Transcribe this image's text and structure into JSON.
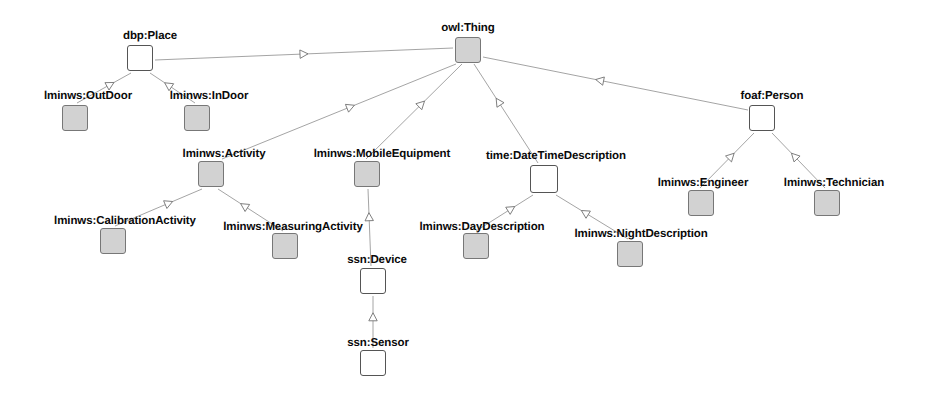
{
  "diagram": {
    "kind": "ontology-class-hierarchy",
    "background_color": "#ffffff",
    "node_fill_shaded": "#d2d2d2",
    "node_fill_hollow": "#ffffff",
    "edge_color": "#9a9a9a",
    "label_color": "#0a0a0a",
    "edge_style": "uml-generalization-hollow-triangle"
  },
  "nodes": [
    {
      "id": "owl_thing",
      "label": "owl:Thing",
      "fill": "filled",
      "box": {
        "x": 455,
        "y": 37,
        "w": 26,
        "h": 26
      },
      "label_x": 468,
      "label_y": 22
    },
    {
      "id": "dbp_place",
      "label": "dbp:Place",
      "fill": "hollow",
      "box": {
        "x": 127,
        "y": 45,
        "w": 26,
        "h": 26
      },
      "label_x": 150,
      "label_y": 30
    },
    {
      "id": "lminws_outdoor",
      "label": "lminws:OutDoor",
      "fill": "filled",
      "box": {
        "x": 62,
        "y": 105,
        "w": 26,
        "h": 26
      },
      "label_x": 88,
      "label_y": 90
    },
    {
      "id": "lminws_indoor",
      "label": "lminws:InDoor",
      "fill": "filled",
      "box": {
        "x": 184,
        "y": 105,
        "w": 26,
        "h": 26
      },
      "label_x": 209,
      "label_y": 90
    },
    {
      "id": "foaf_person",
      "label": "foaf:Person",
      "fill": "hollow",
      "box": {
        "x": 749,
        "y": 105,
        "w": 26,
        "h": 26
      },
      "label_x": 772,
      "label_y": 90
    },
    {
      "id": "lminws_activity",
      "label": "lminws:Activity",
      "fill": "filled",
      "box": {
        "x": 198,
        "y": 161,
        "w": 26,
        "h": 26
      },
      "label_x": 224,
      "label_y": 148
    },
    {
      "id": "lminws_mobileequip",
      "label": "lminws:MobileEquipment",
      "fill": "filled",
      "box": {
        "x": 354,
        "y": 161,
        "w": 26,
        "h": 26
      },
      "label_x": 382,
      "label_y": 148
    },
    {
      "id": "time_datetimedesc",
      "label": "time:DateTimeDescription",
      "fill": "hollow",
      "box": {
        "x": 530,
        "y": 165,
        "w": 28,
        "h": 28
      },
      "label_x": 556,
      "label_y": 150
    },
    {
      "id": "lminws_engineer",
      "label": "lminws:Engineer",
      "fill": "filled",
      "box": {
        "x": 688,
        "y": 190,
        "w": 26,
        "h": 26
      },
      "label_x": 703,
      "label_y": 177
    },
    {
      "id": "lminws_technician",
      "label": "lminws:Technician",
      "fill": "filled",
      "box": {
        "x": 814,
        "y": 190,
        "w": 26,
        "h": 26
      },
      "label_x": 834,
      "label_y": 177
    },
    {
      "id": "lminws_calibration",
      "label": "lminws:CalibrationActivity",
      "fill": "filled",
      "box": {
        "x": 100,
        "y": 228,
        "w": 26,
        "h": 26
      },
      "label_x": 125,
      "label_y": 215
    },
    {
      "id": "lminws_measuring",
      "label": "lminws:MeasuringActivity",
      "fill": "filled",
      "box": {
        "x": 272,
        "y": 233,
        "w": 26,
        "h": 26
      },
      "label_x": 293,
      "label_y": 221
    },
    {
      "id": "lminws_daydesc",
      "label": "lminws:DayDescription",
      "fill": "filled",
      "box": {
        "x": 463,
        "y": 233,
        "w": 26,
        "h": 26
      },
      "label_x": 482,
      "label_y": 221
    },
    {
      "id": "lminws_nightdesc",
      "label": "lminws:NightDescription",
      "fill": "filled",
      "box": {
        "x": 617,
        "y": 241,
        "w": 26,
        "h": 26
      },
      "label_x": 641,
      "label_y": 228
    },
    {
      "id": "ssn_device",
      "label": "ssn:Device",
      "fill": "hollow",
      "box": {
        "x": 360,
        "y": 268,
        "w": 26,
        "h": 26
      },
      "label_x": 377,
      "label_y": 254
    },
    {
      "id": "ssn_sensor",
      "label": "ssn:Sensor",
      "fill": "hollow",
      "box": {
        "x": 360,
        "y": 350,
        "w": 26,
        "h": 26
      },
      "label_x": 378,
      "label_y": 337
    }
  ],
  "edges": [
    {
      "id": "e_place_thing",
      "from": "dbp_place",
      "to": "owl_thing",
      "x1": 155,
      "y1": 60,
      "x2": 453,
      "y2": 48,
      "arrow_t": 0.5
    },
    {
      "id": "e_outdoor_place",
      "from": "lminws_outdoor",
      "to": "dbp_place",
      "x1": 77,
      "y1": 103,
      "x2": 131,
      "y2": 73,
      "arrow_t": 0.62
    },
    {
      "id": "e_indoor_place",
      "from": "lminws_indoor",
      "to": "dbp_place",
      "x1": 195,
      "y1": 103,
      "x2": 150,
      "y2": 73,
      "arrow_t": 0.6
    },
    {
      "id": "e_person_thing",
      "from": "foaf_person",
      "to": "owl_thing",
      "x1": 748,
      "y1": 110,
      "x2": 483,
      "y2": 57,
      "arrow_t": 0.56
    },
    {
      "id": "e_activity_thing",
      "from": "lminws_activity",
      "to": "owl_thing",
      "x1": 222,
      "y1": 159,
      "x2": 456,
      "y2": 64,
      "arrow_t": 0.55
    },
    {
      "id": "e_mobile_thing",
      "from": "lminws_mobileequip",
      "to": "owl_thing",
      "x1": 366,
      "y1": 159,
      "x2": 462,
      "y2": 64,
      "arrow_t": 0.58
    },
    {
      "id": "e_datetime_thing",
      "from": "time_datetimedesc",
      "to": "owl_thing",
      "x1": 538,
      "y1": 163,
      "x2": 474,
      "y2": 64,
      "arrow_t": 0.62
    },
    {
      "id": "e_engineer_person",
      "from": "lminws_engineer",
      "to": "foaf_person",
      "x1": 700,
      "y1": 188,
      "x2": 754,
      "y2": 133,
      "arrow_t": 0.58
    },
    {
      "id": "e_technician_person",
      "from": "lminws_technician",
      "to": "foaf_person",
      "x1": 825,
      "y1": 188,
      "x2": 772,
      "y2": 133,
      "arrow_t": 0.58
    },
    {
      "id": "e_calib_activity",
      "from": "lminws_calibration",
      "to": "lminws_activity",
      "x1": 115,
      "y1": 226,
      "x2": 202,
      "y2": 189,
      "arrow_t": 0.62
    },
    {
      "id": "e_measuring_activity",
      "from": "lminws_measuring",
      "to": "lminws_activity",
      "x1": 283,
      "y1": 231,
      "x2": 218,
      "y2": 189,
      "arrow_t": 0.6
    },
    {
      "id": "e_device_mobile",
      "from": "ssn_device",
      "to": "lminws_mobileequip",
      "x1": 371,
      "y1": 266,
      "x2": 368,
      "y2": 189,
      "arrow_t": 0.64
    },
    {
      "id": "e_sensor_device",
      "from": "ssn_sensor",
      "to": "ssn_device",
      "x1": 373,
      "y1": 348,
      "x2": 373,
      "y2": 296,
      "arrow_t": 0.6
    },
    {
      "id": "e_day_datetime",
      "from": "lminws_daydesc",
      "to": "time_datetimedesc",
      "x1": 476,
      "y1": 231,
      "x2": 533,
      "y2": 195,
      "arrow_t": 0.62
    },
    {
      "id": "e_night_datetime",
      "from": "lminws_nightdesc",
      "to": "time_datetimedesc",
      "x1": 628,
      "y1": 239,
      "x2": 556,
      "y2": 195,
      "arrow_t": 0.6
    }
  ]
}
